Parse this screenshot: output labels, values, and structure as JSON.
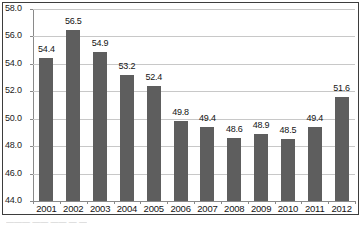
{
  "chart_data": {
    "type": "bar",
    "title": "",
    "xlabel": "",
    "ylabel": "",
    "categories": [
      "2001",
      "2002",
      "2003",
      "2004",
      "2005",
      "2006",
      "2007",
      "2008",
      "2009",
      "2010",
      "2011",
      "2012"
    ],
    "values": [
      54.4,
      56.5,
      54.9,
      53.2,
      52.4,
      49.8,
      49.4,
      48.6,
      48.9,
      48.5,
      49.4,
      51.6
    ],
    "value_labels": [
      "54.4",
      "56.5",
      "54.9",
      "53.2",
      "52.4",
      "49.8",
      "49.4",
      "48.6",
      "48.9",
      "48.5",
      "49.4",
      "51.6"
    ],
    "ylim": [
      44.0,
      58.0
    ],
    "ytick_values": [
      44.0,
      46.0,
      48.0,
      50.0,
      52.0,
      54.0,
      56.0,
      58.0
    ],
    "ytick_labels": [
      "44.0",
      "46.0",
      "48.0",
      "50.0",
      "52.0",
      "54.0",
      "56.0",
      "58.0"
    ],
    "grid": true,
    "legend": false,
    "legend_position": "none",
    "bar_color": "#5e5e5e",
    "gridline_color": "#c8c8c8",
    "axis_color": "#8a8a8a",
    "border_color": "#3d3d3d",
    "background_color": "#ffffff",
    "data_labels_shown": true
  },
  "caption": {
    "clipped_text": "——— —— ——  —   —"
  }
}
